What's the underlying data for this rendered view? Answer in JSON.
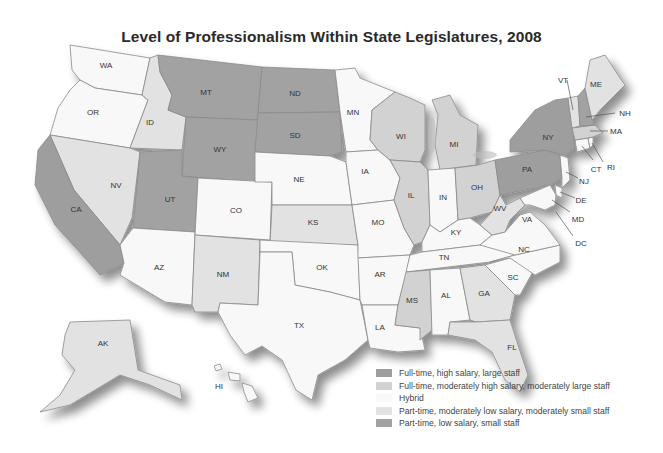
{
  "title": "Level of Professionalism Within State Legislatures, 2008",
  "categories": {
    "ft_high": {
      "label": "Full-time, high salary, large staff",
      "color": "#9e9e9e"
    },
    "ft_mod": {
      "label": "Full-time, moderately high salary, moderately large staff",
      "color": "#d2d2d2"
    },
    "hybrid": {
      "label": "Hybrid",
      "color": "#f8f8f8"
    },
    "pt_mod": {
      "label": "Part-time, moderately low salary, moderately small staff",
      "color": "#e2e2e2"
    },
    "pt_low": {
      "label": "Part-time, low salary, small staff",
      "color": "#a2a2a2"
    }
  },
  "legend": [
    {
      "key": "ft_high",
      "label": "Full-time, high salary, large staff",
      "color": "#9e9e9e"
    },
    {
      "key": "ft_mod",
      "label": "Full-time, moderately high salary, moderately large staff",
      "color": "#d2d2d2"
    },
    {
      "key": "hybrid",
      "label": "Hybrid",
      "color": "#f8f8f8"
    },
    {
      "key": "pt_mod",
      "label": "Part-time, moderately low salary, moderately small staff",
      "color": "#e2e2e2"
    },
    {
      "key": "pt_low",
      "label": "Part-time, low salary, small staff",
      "color": "#a2a2a2"
    }
  ],
  "states": {
    "WA": "hybrid",
    "OR": "hybrid",
    "ID": "pt_mod",
    "MT": "pt_low",
    "ND": "pt_low",
    "SD": "pt_low",
    "WY": "pt_low",
    "UT": "pt_low",
    "NV": "pt_mod",
    "CA": "ft_high",
    "AZ": "hybrid",
    "NM": "pt_mod",
    "CO": "hybrid",
    "NE": "hybrid",
    "KS": "pt_mod",
    "OK": "hybrid",
    "TX": "hybrid",
    "MN": "hybrid",
    "IA": "hybrid",
    "MO": "hybrid",
    "AR": "hybrid",
    "LA": "hybrid",
    "WI": "ft_mod",
    "IL": "ft_mod",
    "MI": "ft_mod",
    "IN": "hybrid",
    "OH": "ft_mod",
    "KY": "hybrid",
    "TN": "hybrid",
    "MS": "ft_mod",
    "AL": "hybrid",
    "GA": "pt_mod",
    "FL": "pt_mod",
    "SC": "hybrid",
    "NC": "hybrid",
    "VA": "hybrid",
    "WV": "pt_mod",
    "PA": "ft_high",
    "NY": "ft_high",
    "VT": "pt_mod",
    "NH": "pt_low",
    "ME": "pt_mod",
    "MA": "ft_mod",
    "RI": "hybrid",
    "CT": "hybrid",
    "NJ": "hybrid",
    "DE": "hybrid",
    "MD": "hybrid",
    "DC": "hybrid",
    "AK": "pt_mod",
    "HI": "hybrid"
  },
  "labels": {
    "WA": "WA",
    "OR": "OR",
    "ID": "ID",
    "MT": "MT",
    "ND": "ND",
    "SD": "SD",
    "WY": "WY",
    "UT": "UT",
    "NV": "NV",
    "CA": "CA",
    "AZ": "AZ",
    "NM": "NM",
    "CO": "CO",
    "NE": "NE",
    "KS": "KS",
    "OK": "OK",
    "TX": "TX",
    "MN": "MN",
    "IA": "IA",
    "MO": "MO",
    "AR": "AR",
    "LA": "LA",
    "WI": "WI",
    "IL": "IL",
    "MI": "MI",
    "IN": "IN",
    "OH": "OH",
    "KY": "KY",
    "TN": "TN",
    "MS": "MS",
    "AL": "AL",
    "GA": "GA",
    "FL": "FL",
    "SC": "SC",
    "NC": "NC",
    "VA": "VA",
    "WV": "WV",
    "PA": "PA",
    "NY": "NY",
    "VT": "VT",
    "NH": "NH",
    "ME": "ME",
    "MA": "MA",
    "RI": "RI",
    "CT": "CT",
    "NJ": "NJ",
    "DE": "DE",
    "MD": "MD",
    "DC": "DC",
    "AK": "AK",
    "HI": "HI"
  }
}
